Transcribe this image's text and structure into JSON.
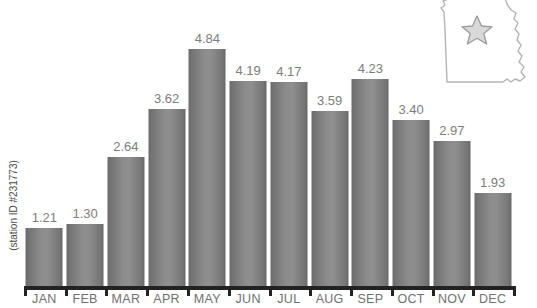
{
  "title": "for Columbia, Missouri",
  "y_axis_caption": "(station ID #231773)",
  "map": {
    "state_name": "Missouri",
    "marker": "star-marker",
    "outline_color": "#b4b4b4",
    "marker_fill": "#d9d9d9",
    "marker_stroke": "#9a9a9a"
  },
  "colors": {
    "bar_dark": "#6b6b6b",
    "bar_light": "#8f8f8f",
    "axis": "#222222",
    "value_label": "#7d7d7d",
    "month_label": "#6f6f6f",
    "title": "#1d1d1d"
  },
  "chart_data": {
    "type": "bar",
    "title": "for Columbia, Missouri",
    "xlabel": "",
    "ylabel": "(station ID #231773)",
    "ylim": [
      0,
      5.3
    ],
    "grid": false,
    "legend": "none",
    "categories": [
      "JAN",
      "FEB",
      "MAR",
      "APR",
      "MAY",
      "JUN",
      "JUL",
      "AUG",
      "SEP",
      "OCT",
      "NOV",
      "DEC"
    ],
    "values": [
      1.21,
      1.3,
      2.64,
      3.62,
      4.84,
      4.19,
      4.17,
      3.59,
      4.23,
      3.4,
      2.97,
      1.93
    ],
    "value_labels": [
      "1.21",
      "1.30",
      "2.64",
      "3.62",
      "4.84",
      "4.19",
      "4.17",
      "3.59",
      "4.23",
      "3.40",
      "2.97",
      "1.93"
    ]
  }
}
